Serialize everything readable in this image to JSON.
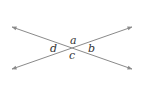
{
  "diagram": {
    "colors": {
      "line": "#8a8a8a",
      "text": "#333333",
      "background": "#ffffff"
    },
    "lines": [
      {
        "name": "line-1",
        "x1": 12,
        "y1": 27,
        "x2": 132,
        "y2": 69
      },
      {
        "name": "line-2",
        "x1": 12,
        "y1": 69,
        "x2": 132,
        "y2": 27
      }
    ],
    "intersection": {
      "x": 72,
      "y": 48
    },
    "angle_labels": [
      {
        "name": "a",
        "text": "a",
        "x": 70,
        "y": 44,
        "position": "top"
      },
      {
        "name": "b",
        "text": "b",
        "x": 88,
        "y": 52,
        "position": "right"
      },
      {
        "name": "c",
        "text": "c",
        "x": 69,
        "y": 59,
        "position": "bottom"
      },
      {
        "name": "d",
        "text": "d",
        "x": 50,
        "y": 52,
        "position": "left"
      }
    ]
  }
}
